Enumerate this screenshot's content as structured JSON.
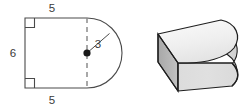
{
  "figure": {
    "cross_section": {
      "name": "2d-cross-section",
      "shape": "rectangle-with-semicircle",
      "fill_color": "#ffffff",
      "stroke_color": "#4a4a4a",
      "labels": [
        {
          "id": "top-side",
          "text": "5",
          "x": 52,
          "y": 12,
          "meaning": "top side of rectangle"
        },
        {
          "id": "left-side",
          "text": "6",
          "x": 13,
          "y": 57,
          "meaning": "height of rectangle"
        },
        {
          "id": "bottom-side",
          "text": "5",
          "x": 52,
          "y": 102,
          "meaning": "bottom side of rectangle"
        },
        {
          "id": "radius",
          "text": "3",
          "x": 97,
          "y": 48,
          "meaning": "radius of semicircle"
        }
      ],
      "right_angle_markers": [
        {
          "id": "top-left-right-angle",
          "x": 25,
          "y": 18
        },
        {
          "id": "bottom-left-right-angle",
          "x": 25,
          "y": 88
        }
      ],
      "center_point": {
        "x": 87,
        "y": 53
      },
      "dashed_diameter": {
        "x": 87,
        "y1": 18,
        "y2": 88,
        "color": "#8c8c8c"
      },
      "radius_line": {
        "x1": 87,
        "y1": 53,
        "x2": 109,
        "y2": 33
      },
      "rect": {
        "x": 25,
        "y": 18,
        "width": 62,
        "height": 70
      },
      "semicircle_radius": 35
    },
    "solid": {
      "name": "3d-solid",
      "shape": "prism-with-semicircular-cross-section",
      "top_face_color": "#f2f2f2",
      "left_face_color": "#b2b2b2",
      "front_face_color": "#d9d9d9",
      "curved_face_color": "#e3e3e3",
      "stroke_color": "#1f1f1f"
    }
  },
  "colors": {
    "background": "#ffffff",
    "line": "#4a4a4a",
    "dashed": "#8c8c8c",
    "text": "#3a3a3a",
    "solid_outline": "#1f1f1f"
  }
}
